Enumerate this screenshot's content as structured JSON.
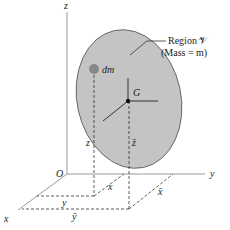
{
  "diagram": {
    "region_label_line1": "Region 𝒱",
    "region_label_line2": "(Mass = m)",
    "element_label": "dm",
    "centroid_label": "G",
    "origin_label": "O",
    "axes": {
      "x": "x",
      "y": "y",
      "z": "z"
    },
    "element_coords": {
      "x": "x",
      "y": "y",
      "z": "z"
    },
    "centroid_coords": {
      "x": "x̄",
      "y": "ȳ",
      "z": "z̄"
    },
    "colors": {
      "region_fill": "#c4c4c4",
      "region_stroke": "#555555",
      "axis_stroke": "#9a9a9a",
      "dash_stroke": "#333333",
      "element_fill": "#888888"
    }
  }
}
